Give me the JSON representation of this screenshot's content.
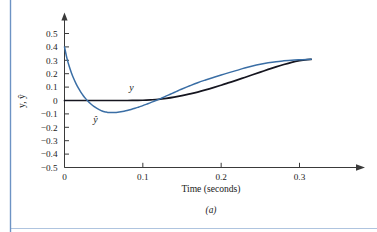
{
  "figure": {
    "caption": "(a)",
    "left_rule_color": "#6d93c4",
    "bottom_rule_color": "#9fb9d8"
  },
  "chart_data": {
    "type": "line",
    "title": "",
    "xlabel": "Time (seconds)",
    "ylabel": "y, ŷ",
    "xlim": [
      0,
      0.34
    ],
    "ylim": [
      -0.5,
      0.55
    ],
    "grid": false,
    "legend": "inline-labels",
    "x_ticks": [
      "0",
      "0.1",
      "0.2",
      "0.3"
    ],
    "x_tick_values": [
      0,
      0.1,
      0.2,
      0.3
    ],
    "y_ticks": [
      "0.5",
      "0.4",
      "0.3",
      "0.2",
      "0.1",
      "0",
      "−0.1",
      "−0.2",
      "−0.3",
      "−0.4",
      "−0.5"
    ],
    "y_tick_values": [
      0.5,
      0.4,
      0.3,
      0.2,
      0.1,
      0,
      -0.1,
      -0.2,
      -0.3,
      -0.4,
      -0.5
    ],
    "series": [
      {
        "name": "y",
        "label": "y",
        "color": "#15151f",
        "width": 1.7,
        "label_x": 0.0855,
        "label_y": 0.072,
        "points": [
          [
            0.0,
            0.0
          ],
          [
            0.01,
            0.0
          ],
          [
            0.02,
            0.0
          ],
          [
            0.03,
            0.0
          ],
          [
            0.04,
            0.0
          ],
          [
            0.05,
            0.0
          ],
          [
            0.06,
            0.0
          ],
          [
            0.07,
            0.0
          ],
          [
            0.08,
            0.0
          ],
          [
            0.09,
            0.001
          ],
          [
            0.1,
            0.002
          ],
          [
            0.11,
            0.005
          ],
          [
            0.12,
            0.009
          ],
          [
            0.13,
            0.016
          ],
          [
            0.14,
            0.025
          ],
          [
            0.15,
            0.036
          ],
          [
            0.16,
            0.049
          ],
          [
            0.17,
            0.063
          ],
          [
            0.18,
            0.079
          ],
          [
            0.19,
            0.096
          ],
          [
            0.2,
            0.114
          ],
          [
            0.21,
            0.133
          ],
          [
            0.22,
            0.152
          ],
          [
            0.23,
            0.172
          ],
          [
            0.24,
            0.192
          ],
          [
            0.25,
            0.212
          ],
          [
            0.26,
            0.232
          ],
          [
            0.27,
            0.251
          ],
          [
            0.28,
            0.269
          ],
          [
            0.29,
            0.285
          ],
          [
            0.3,
            0.297
          ],
          [
            0.31,
            0.305
          ],
          [
            0.315,
            0.307
          ]
        ]
      },
      {
        "name": "y_hat",
        "label": "ŷ",
        "color": "#3a6ea5",
        "width": 1.5,
        "label_x": 0.0395,
        "label_y": -0.168,
        "points": [
          [
            0.0,
            0.4
          ],
          [
            0.003,
            0.318
          ],
          [
            0.006,
            0.255
          ],
          [
            0.009,
            0.204
          ],
          [
            0.012,
            0.16
          ],
          [
            0.015,
            0.122
          ],
          [
            0.018,
            0.09
          ],
          [
            0.021,
            0.061
          ],
          [
            0.024,
            0.036
          ],
          [
            0.027,
            0.014
          ],
          [
            0.03,
            -0.005
          ],
          [
            0.033,
            -0.022
          ],
          [
            0.036,
            -0.037
          ],
          [
            0.039,
            -0.05
          ],
          [
            0.042,
            -0.061
          ],
          [
            0.045,
            -0.07
          ],
          [
            0.048,
            -0.078
          ],
          [
            0.051,
            -0.084
          ],
          [
            0.054,
            -0.087
          ],
          [
            0.057,
            -0.089
          ],
          [
            0.06,
            -0.09
          ],
          [
            0.064,
            -0.089
          ],
          [
            0.068,
            -0.087
          ],
          [
            0.072,
            -0.084
          ],
          [
            0.076,
            -0.08
          ],
          [
            0.08,
            -0.075
          ],
          [
            0.085,
            -0.067
          ],
          [
            0.09,
            -0.058
          ],
          [
            0.095,
            -0.048
          ],
          [
            0.1,
            -0.038
          ],
          [
            0.105,
            -0.027
          ],
          [
            0.11,
            -0.016
          ],
          [
            0.115,
            -0.004
          ],
          [
            0.12,
            0.008
          ],
          [
            0.125,
            0.021
          ],
          [
            0.13,
            0.034
          ],
          [
            0.135,
            0.047
          ],
          [
            0.14,
            0.06
          ],
          [
            0.145,
            0.073
          ],
          [
            0.15,
            0.086
          ],
          [
            0.16,
            0.11
          ],
          [
            0.17,
            0.133
          ],
          [
            0.18,
            0.153
          ],
          [
            0.19,
            0.172
          ],
          [
            0.2,
            0.19
          ],
          [
            0.21,
            0.208
          ],
          [
            0.22,
            0.225
          ],
          [
            0.23,
            0.242
          ],
          [
            0.24,
            0.257
          ],
          [
            0.25,
            0.27
          ],
          [
            0.26,
            0.281
          ],
          [
            0.27,
            0.29
          ],
          [
            0.28,
            0.296
          ],
          [
            0.29,
            0.301
          ],
          [
            0.3,
            0.304
          ],
          [
            0.31,
            0.306
          ],
          [
            0.315,
            0.307
          ]
        ]
      }
    ]
  }
}
